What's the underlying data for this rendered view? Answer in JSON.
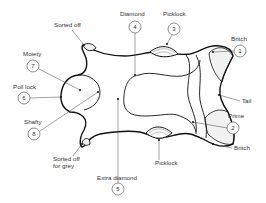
{
  "diagram": {
    "colors": {
      "outline": "#111111",
      "leader": "#444444",
      "text": "#333333",
      "hatch": "#999999"
    },
    "labels": [
      {
        "id": "sorted_off_top",
        "text": "Sorted off",
        "x": 54,
        "y": 27
      },
      {
        "id": "diamond",
        "text": "Diamond",
        "number": "4",
        "x": 120,
        "y": 16,
        "cx": 135,
        "cy": 27
      },
      {
        "id": "picklock_top",
        "text": "Picklock",
        "number": "3",
        "x": 163,
        "y": 16,
        "cx": 174,
        "cy": 29
      },
      {
        "id": "britch_top",
        "text": "Britch",
        "number": "1",
        "x": 231,
        "y": 41,
        "cx": 240,
        "cy": 51
      },
      {
        "id": "moiety",
        "text": "Moiety",
        "number": "7",
        "x": 23,
        "y": 56,
        "cx": 33,
        "cy": 66
      },
      {
        "id": "poll_lock",
        "text": "Poll lock",
        "number": "6",
        "x": 13,
        "y": 89,
        "cx": 24,
        "cy": 98
      },
      {
        "id": "tail",
        "text": "Tail",
        "x": 242,
        "y": 101
      },
      {
        "id": "shafty",
        "text": "Shafty",
        "number": "8",
        "x": 24,
        "y": 122,
        "cx": 34,
        "cy": 134
      },
      {
        "id": "prime",
        "text": "Prime",
        "number": "2",
        "x": 228,
        "y": 118,
        "cx": 233,
        "cy": 128
      },
      {
        "id": "britch_bottom",
        "text": "Britch",
        "x": 234,
        "y": 150
      },
      {
        "id": "sorted_off_grey_1",
        "text": "Sorted off",
        "x": 53,
        "y": 160
      },
      {
        "id": "sorted_off_grey_2",
        "text": "for grey",
        "x": 53,
        "y": 168
      },
      {
        "id": "picklock_bottom",
        "text": "Picklock",
        "x": 155,
        "y": 165
      },
      {
        "id": "extra_diamond",
        "text": "Extra diamond",
        "number": "5",
        "x": 97,
        "y": 180,
        "cx": 118,
        "cy": 189
      }
    ]
  }
}
